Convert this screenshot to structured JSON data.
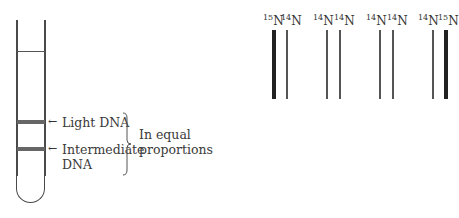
{
  "tube": {
    "bands": [
      {
        "label": "Light DNA",
        "arrow": "←"
      },
      {
        "label_line1": "Intermediate",
        "label_line2": "DNA",
        "arrow": "←"
      }
    ],
    "brace_label_line1": "In equal",
    "brace_label_line2": "proportions"
  },
  "strands": {
    "pairs": [
      {
        "left": {
          "mass": "15",
          "element": "N"
        },
        "right": {
          "mass": "14",
          "element": "N"
        }
      },
      {
        "left": {
          "mass": "14",
          "element": "N"
        },
        "right": {
          "mass": "14",
          "element": "N"
        }
      },
      {
        "left": {
          "mass": "14",
          "element": "N"
        },
        "right": {
          "mass": "14",
          "element": "N"
        }
      },
      {
        "left": {
          "mass": "14",
          "element": "N"
        },
        "right": {
          "mass": "15",
          "element": "N"
        }
      }
    ],
    "colors": {
      "heavy": "#222222",
      "light": "#555555"
    }
  }
}
